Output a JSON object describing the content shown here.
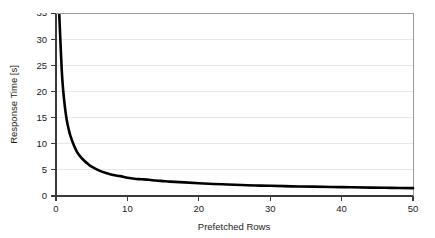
{
  "chart_data": {
    "type": "line",
    "title": "",
    "xlabel": "Prefetched Rows",
    "ylabel": "Response Time [s]",
    "xlim": [
      0,
      50
    ],
    "ylim": [
      0,
      35
    ],
    "xticks": [
      0,
      10,
      20,
      30,
      40,
      50
    ],
    "yticks": [
      0,
      5,
      10,
      15,
      20,
      25,
      30,
      35
    ],
    "xtick_labels": [
      "0",
      "10",
      "20",
      "30",
      "40",
      "50"
    ],
    "ytick_labels": [
      "0",
      "5",
      "10",
      "15",
      "20",
      "25",
      "30",
      "35"
    ],
    "grid": "horizontal",
    "grid_color": "#e2e2e2",
    "legend": "none",
    "series": [
      {
        "name": "Response Time",
        "color": "#000000",
        "line_width": 2.6,
        "x": [
          0.45,
          0.6,
          0.8,
          1.0,
          1.25,
          1.5,
          1.75,
          2.0,
          2.5,
          3.0,
          3.5,
          4.0,
          4.5,
          5.0,
          6.0,
          7.0,
          8.0,
          9.0,
          10.0,
          11.0,
          12.0,
          13.0,
          14.0,
          15.0,
          16.0,
          18.0,
          20.0,
          22.0,
          24.0,
          26.0,
          28.0,
          30.0,
          33.0,
          36.0,
          40.0,
          44.0,
          47.0,
          50.0
        ],
        "y": [
          35.0,
          30.2,
          24.2,
          20.3,
          17.0,
          14.6,
          12.9,
          11.6,
          9.7,
          8.3,
          7.4,
          6.7,
          6.1,
          5.6,
          4.9,
          4.4,
          4.0,
          3.8,
          3.5,
          3.3,
          3.2,
          3.1,
          2.95,
          2.85,
          2.75,
          2.6,
          2.45,
          2.3,
          2.2,
          2.1,
          2.0,
          1.95,
          1.85,
          1.8,
          1.7,
          1.6,
          1.55,
          1.5
        ]
      }
    ]
  },
  "axes": {
    "x_title": "Prefetched Rows",
    "y_title": "Response Time [s]"
  }
}
